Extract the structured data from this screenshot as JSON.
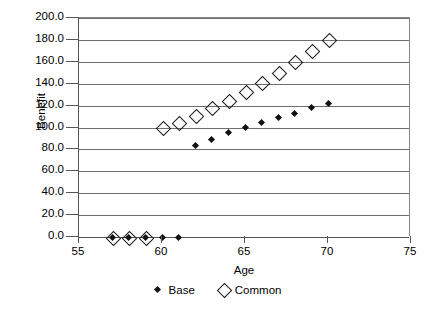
{
  "chart_data": {
    "type": "scatter",
    "title": "",
    "xlabel": "Age",
    "ylabel": "Benefit",
    "xlim": [
      55,
      75
    ],
    "ylim": [
      0.0,
      200.0
    ],
    "xticks": [
      "55",
      "60",
      "65",
      "70",
      "75"
    ],
    "xtick_values": [
      55,
      60,
      65,
      70,
      75
    ],
    "yticks": [
      "0.0",
      "20.0",
      "40.0",
      "60.0",
      "80.0",
      "100.0",
      "120.0",
      "140.0",
      "160.0",
      "180.0",
      "200.0"
    ],
    "ytick_values": [
      0,
      20,
      40,
      60,
      80,
      100,
      120,
      140,
      160,
      180,
      200
    ],
    "grid": "horizontal",
    "legend_position": "bottom",
    "x": [
      57,
      58,
      59,
      60,
      61,
      62,
      63,
      64,
      65,
      66,
      67,
      68,
      69,
      70
    ],
    "series": [
      {
        "name": "Base",
        "marker": "filled-diamond",
        "color": "#111111",
        "values": [
          0.0,
          0.0,
          0.0,
          0.0,
          0.0,
          84.0,
          89.0,
          95.0,
          100.0,
          105.0,
          109.0,
          113.0,
          118.0,
          122.0
        ]
      },
      {
        "name": "Common",
        "marker": "open-diamond",
        "color": "#1a1a1a",
        "values": [
          0.0,
          0.0,
          0.0,
          100.0,
          105.0,
          111.0,
          118.0,
          125.0,
          133.0,
          141.0,
          150.0,
          160.0,
          170.0,
          180.0
        ]
      }
    ]
  },
  "legend": {
    "entries": [
      {
        "label": "Base",
        "marker": "filled-diamond"
      },
      {
        "label": "Common",
        "marker": "open-diamond"
      }
    ]
  }
}
